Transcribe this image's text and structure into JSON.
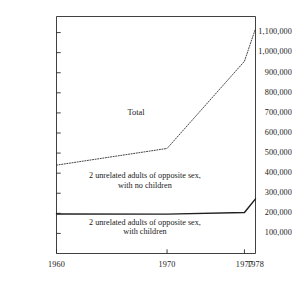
{
  "chart_data": {
    "type": "line",
    "title": "",
    "xlabel": "",
    "ylabel": "",
    "xlim": [
      1960,
      1978
    ],
    "ylim": [
      0,
      1180000
    ],
    "grid": false,
    "legend_position": "inline-annotations",
    "xticks": [
      "1960",
      "1970",
      "1977",
      "1978"
    ],
    "xtick_values": [
      1960,
      1970,
      1977,
      1978
    ],
    "yticks": [
      "1,100,000",
      "1,000,000",
      "900,000",
      "800,000",
      "700,000",
      "600,000",
      "500,000",
      "400,000",
      "300,000",
      "200,000",
      "100,000"
    ],
    "ytick_values": [
      1100000,
      1000000,
      900000,
      800000,
      700000,
      600000,
      500000,
      400000,
      300000,
      200000,
      100000
    ],
    "series": [
      {
        "name": "Total",
        "style": "dotted",
        "x": [
          1960,
          1970,
          1977,
          1978
        ],
        "values": [
          440000,
          523000,
          957000,
          1120000
        ]
      },
      {
        "name": "2 unrelated adults of opposite sex, with children",
        "style": "solid",
        "x": [
          1960,
          1970,
          1977,
          1978
        ],
        "values": [
          197000,
          196000,
          204000,
          272000
        ]
      }
    ],
    "annotations": [
      {
        "text": "Total",
        "x": 1967.2,
        "y": 700000
      },
      {
        "text": "2 unrelated adults of opposite sex,",
        "x": 1968.0,
        "y": 385000
      },
      {
        "text": "with no children",
        "x": 1968.0,
        "y": 337000
      },
      {
        "text": "2 unrelated adults of opposite sex,",
        "x": 1968.0,
        "y": 152000
      },
      {
        "text": "with children",
        "x": 1968.0,
        "y": 105000
      }
    ],
    "colors": {
      "axis": "#2b2b2b",
      "total_line": "#3a3a3a",
      "children_line": "#1f1f1f",
      "text": "#1a1a1a",
      "background": "#ffffff"
    }
  }
}
